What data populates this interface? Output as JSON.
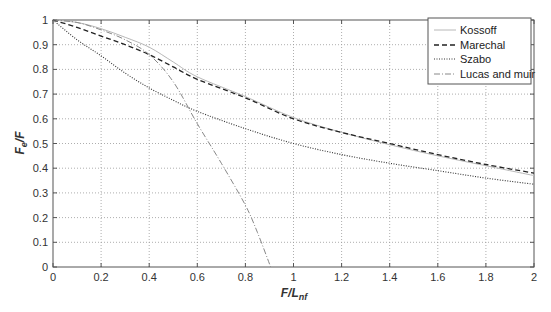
{
  "chart_data": {
    "type": "line",
    "title": "",
    "xlabel": "F/L_nf",
    "ylabel": "F_e/F",
    "xlim": [
      0,
      2
    ],
    "ylim": [
      0,
      1
    ],
    "grid": true,
    "legend_position": "upper right",
    "x_ticks": [
      "0",
      "0.2",
      "0.4",
      "0.6",
      "0.8",
      "1",
      "1.2",
      "1.4",
      "1.6",
      "1.8",
      "2"
    ],
    "y_ticks": [
      "0",
      "0.1",
      "0.2",
      "0.3",
      "0.4",
      "0.5",
      "0.6",
      "0.7",
      "0.8",
      "0.9",
      "1"
    ],
    "series": [
      {
        "name": "Kossoff",
        "style": "solid-light",
        "x": [
          0,
          0.1,
          0.2,
          0.3,
          0.4,
          0.5,
          0.6,
          0.8,
          1.0,
          1.2,
          1.4,
          1.6,
          1.8,
          2.0
        ],
        "y": [
          1.0,
          0.99,
          0.965,
          0.93,
          0.89,
          0.83,
          0.77,
          0.69,
          0.605,
          0.545,
          0.495,
          0.45,
          0.41,
          0.37
        ]
      },
      {
        "name": "Marechal",
        "style": "dashed",
        "x": [
          0,
          0.1,
          0.2,
          0.3,
          0.4,
          0.5,
          0.6,
          0.8,
          1.0,
          1.2,
          1.4,
          1.6,
          1.8,
          2.0
        ],
        "y": [
          1.0,
          0.97,
          0.935,
          0.9,
          0.86,
          0.81,
          0.76,
          0.685,
          0.6,
          0.545,
          0.5,
          0.455,
          0.415,
          0.38
        ]
      },
      {
        "name": "Szabo",
        "style": "dotted",
        "x": [
          0,
          0.1,
          0.2,
          0.3,
          0.4,
          0.5,
          0.6,
          0.8,
          1.0,
          1.2,
          1.4,
          1.6,
          1.8,
          2.0
        ],
        "y": [
          1.0,
          0.92,
          0.855,
          0.785,
          0.725,
          0.675,
          0.63,
          0.56,
          0.5,
          0.455,
          0.42,
          0.39,
          0.36,
          0.335
        ]
      },
      {
        "name": "Lucas and muir",
        "style": "dash-dot",
        "x": [
          0,
          0.1,
          0.2,
          0.3,
          0.4,
          0.5,
          0.6,
          0.7,
          0.8,
          0.85,
          0.905
        ],
        "y": [
          1.0,
          0.99,
          0.96,
          0.92,
          0.86,
          0.75,
          0.58,
          0.42,
          0.25,
          0.14,
          0.0
        ]
      }
    ]
  },
  "legend": {
    "items": [
      {
        "label": "Kossoff"
      },
      {
        "label": "Marechal"
      },
      {
        "label": "Szabo"
      },
      {
        "label": "Lucas and muir"
      }
    ]
  },
  "axes": {
    "xlabel_main": "F/L",
    "xlabel_sub": "nf",
    "ylabel_main": "F",
    "ylabel_sub": "e",
    "ylabel_tail": "/F"
  }
}
